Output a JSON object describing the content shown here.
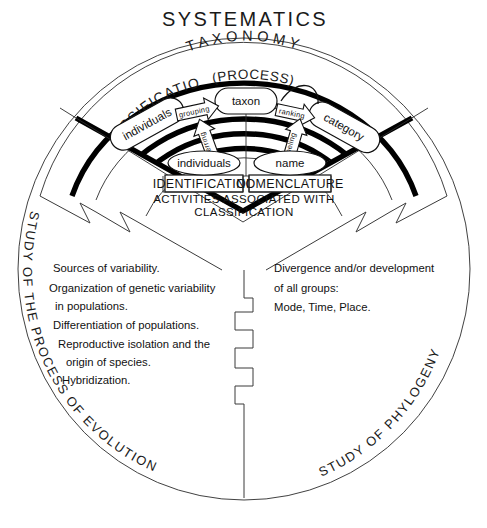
{
  "title": "SYSTEMATICS",
  "arcs": {
    "taxonomy": "TAXONOMY",
    "classification": "CLASSIFICATION",
    "process": "(PROCESS)"
  },
  "rim_labels": {
    "left": "STUDY OF THE PROCESS OF EVOLUTION",
    "right": "STUDY OF PHYLOGENY"
  },
  "ovals": {
    "individuals_top": "individuals",
    "taxon": "taxon",
    "category": "category",
    "individuals_bottom": "individuals",
    "name": "name"
  },
  "arrows": {
    "grouping": "grouping",
    "ranking": "ranking",
    "referring": "referring",
    "labeling": "labeling"
  },
  "boxes": {
    "identification": "IDENTIFICATION",
    "nomenclature": "NOMENCLATURE"
  },
  "activities": {
    "line1": "ACTIVITIES  ASSOCIATED WITH",
    "line2": "CLASSIFICATION"
  },
  "left_block": {
    "lines": [
      "Sources of variability.",
      "Organization of genetic variability",
      "in populations.",
      "Differentiation of populations.",
      "Reproductive isolation and the",
      "origin of species.",
      "Hybridization."
    ]
  },
  "right_block": {
    "lines": [
      "Divergence and/or development",
      "of all groups:",
      "Mode,  Time,  Place."
    ]
  },
  "colors": {
    "ink": "#111111",
    "paper": "#ffffff",
    "hairline": "#3a3a3a"
  }
}
